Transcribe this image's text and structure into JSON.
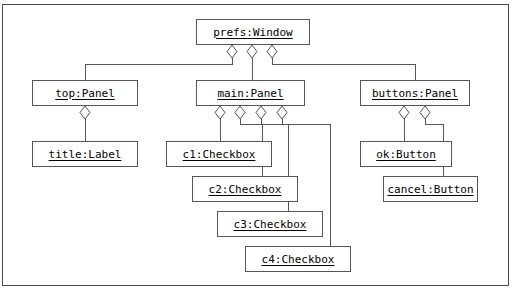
{
  "diagram": {
    "notation": "UML object diagram with aggregation (diamond) connectors",
    "line_color": "#555555",
    "frame_color": "#4a4a4a",
    "background": "#ffffff",
    "nodes": [
      {
        "id": "prefs",
        "label": "prefs:Window",
        "x": 196,
        "y": 19,
        "w": 114,
        "h": 26
      },
      {
        "id": "top",
        "label": "top:Panel",
        "x": 32,
        "y": 80,
        "w": 106,
        "h": 26
      },
      {
        "id": "main",
        "label": "main:Panel",
        "x": 196,
        "y": 80,
        "w": 109,
        "h": 26
      },
      {
        "id": "buttons",
        "label": "buttons:Panel",
        "x": 360,
        "y": 80,
        "w": 110,
        "h": 26
      },
      {
        "id": "title",
        "label": "title:Label",
        "x": 32,
        "y": 141,
        "w": 106,
        "h": 26
      },
      {
        "id": "c1",
        "label": "c1:Checkbox",
        "x": 166,
        "y": 141,
        "w": 106,
        "h": 26
      },
      {
        "id": "c2",
        "label": "c2:Checkbox",
        "x": 192,
        "y": 176,
        "w": 106,
        "h": 26
      },
      {
        "id": "c3",
        "label": "c3:Checkbox",
        "x": 217,
        "y": 211,
        "w": 106,
        "h": 26
      },
      {
        "id": "c4",
        "label": "c4:Checkbox",
        "x": 245,
        "y": 246,
        "w": 106,
        "h": 26
      },
      {
        "id": "ok",
        "label": "ok:Button",
        "x": 360,
        "y": 141,
        "w": 92,
        "h": 26
      },
      {
        "id": "cancel",
        "label": "cancel:Button",
        "x": 383,
        "y": 176,
        "w": 95,
        "h": 26
      }
    ],
    "edges": [
      {
        "from": "prefs",
        "to": "top",
        "diamond_x": 232,
        "diamond_y": 45,
        "drop_y": 64,
        "target_x": 85,
        "target_y": 80
      },
      {
        "from": "prefs",
        "to": "main",
        "diamond_x": 252,
        "diamond_y": 45,
        "drop_y": 64,
        "target_x": 252,
        "target_y": 80
      },
      {
        "from": "prefs",
        "to": "buttons",
        "diamond_x": 272,
        "diamond_y": 45,
        "drop_y": 64,
        "target_x": 415,
        "target_y": 80
      },
      {
        "from": "top",
        "to": "title",
        "diamond_x": 85,
        "diamond_y": 106,
        "drop_y": 124,
        "target_x": 85,
        "target_y": 141
      },
      {
        "from": "main",
        "to": "c1",
        "diamond_x": 220,
        "diamond_y": 106,
        "drop_y": 124,
        "target_x": 220,
        "target_y": 141
      },
      {
        "from": "main",
        "to": "c2",
        "diamond_x": 240,
        "diamond_y": 106,
        "drop_y": 124,
        "target_x": 262,
        "target_y": 176
      },
      {
        "from": "main",
        "to": "c3",
        "diamond_x": 261,
        "diamond_y": 106,
        "drop_y": 124,
        "target_x": 288,
        "target_y": 211
      },
      {
        "from": "main",
        "to": "c4",
        "diamond_x": 282,
        "diamond_y": 106,
        "drop_y": 124,
        "target_x": 330,
        "target_y": 246
      },
      {
        "from": "buttons",
        "to": "ok",
        "diamond_x": 404,
        "diamond_y": 106,
        "drop_y": 124,
        "target_x": 404,
        "target_y": 141
      },
      {
        "from": "buttons",
        "to": "cancel",
        "diamond_x": 425,
        "diamond_y": 106,
        "drop_y": 124,
        "target_x": 443,
        "target_y": 176
      }
    ]
  }
}
